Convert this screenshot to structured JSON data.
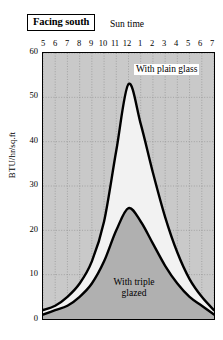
{
  "title": "Facing south",
  "axis": {
    "x_title": "Sun time",
    "y_title": "BTU/hr/sq.ft",
    "x_ticks": [
      "5",
      "6",
      "7",
      "8",
      "9",
      "10",
      "11",
      "12",
      "1",
      "2",
      "3",
      "4",
      "5",
      "6",
      "7"
    ],
    "y_ticks": [
      "60",
      "50",
      "40",
      "30",
      "20",
      "10",
      "0"
    ]
  },
  "annotations": {
    "plain_glass": "With plain glass",
    "triple_glazed_line1": "With triple",
    "triple_glazed_line2": "glazed"
  },
  "colors": {
    "plot_background": "#c9c9c9",
    "fill_light": "#f2f2f2",
    "fill_dark": "#b0b0b0",
    "curve": "#000000",
    "grid": "#8a8a8a",
    "page_background": "#ffffff"
  },
  "chart_data": {
    "type": "line",
    "title": "Facing south",
    "xlabel": "Sun time",
    "ylabel": "BTU/hr/sq.ft",
    "xlim": [
      5,
      19
    ],
    "ylim": [
      0,
      60
    ],
    "x_tick_values": [
      5,
      6,
      7,
      8,
      9,
      10,
      11,
      12,
      13,
      14,
      15,
      16,
      17,
      18,
      19
    ],
    "x_tick_labels": [
      "5",
      "6",
      "7",
      "8",
      "9",
      "10",
      "11",
      "12",
      "1",
      "2",
      "3",
      "4",
      "5",
      "6",
      "7"
    ],
    "y_tick_values": [
      0,
      10,
      20,
      30,
      40,
      50,
      60
    ],
    "grid": true,
    "legend_position": "inline-annotation",
    "series": [
      {
        "name": "With plain glass",
        "fill": "light-gray",
        "x": [
          5,
          6,
          7,
          8,
          9,
          10,
          11,
          12,
          13,
          14,
          15,
          16,
          17,
          18,
          19
        ],
        "values": [
          2,
          3,
          5,
          8,
          13,
          22,
          38,
          53,
          44,
          33,
          23,
          15,
          9,
          5,
          2
        ]
      },
      {
        "name": "With triple glazed",
        "fill": "dark-gray",
        "x": [
          5,
          6,
          7,
          8,
          9,
          10,
          11,
          12,
          13,
          14,
          15,
          16,
          17,
          18,
          19
        ],
        "values": [
          1,
          2,
          3,
          5,
          8,
          13,
          20,
          25,
          22,
          17,
          12,
          8,
          5,
          3,
          1
        ]
      }
    ]
  }
}
